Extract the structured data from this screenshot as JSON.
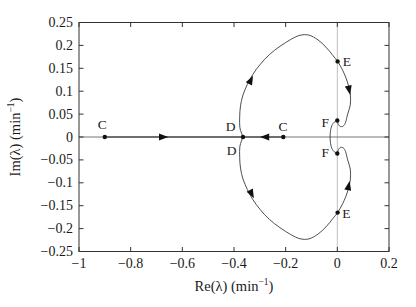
{
  "colors": {
    "curve": "#3a3a3a",
    "frame": "#333333",
    "gridline": "#b8b8b8",
    "real_axis": "#666666",
    "marker": "#111111",
    "text": "#1a1a1a"
  },
  "chart_data": {
    "type": "line",
    "title": "",
    "xlabel": {
      "pre": "Re(λ) (min",
      "sup": "−1",
      "post": ")"
    },
    "ylabel": {
      "pre": "Im(λ) (min",
      "sup": "−1",
      "post": ")"
    },
    "xlim": [
      -1,
      0.2
    ],
    "ylim": [
      -0.25,
      0.25
    ],
    "xticks": {
      "values": [
        -1,
        -0.8,
        -0.6,
        -0.4,
        -0.2,
        0,
        0.2
      ],
      "labels": [
        "−1",
        "−0.8",
        "−0.6",
        "−0.4",
        "−0.2",
        "0",
        "0.2"
      ]
    },
    "yticks": {
      "values": [
        0.25,
        0.2,
        0.15,
        0.1,
        0.05,
        0,
        -0.05,
        -0.1,
        -0.15,
        -0.2,
        -0.25
      ],
      "labels": [
        "0.25",
        "0.2",
        "0.15",
        "0.1",
        "0.05",
        "0",
        "−0.05",
        "−0.1",
        "−0.15",
        "−0.2",
        "−0.25"
      ]
    },
    "grid": {
      "vline_x": 0,
      "hline_y": 0,
      "legend": "none"
    },
    "real_axis_line": {
      "x1": -1,
      "x2": 0.2,
      "y": 0
    },
    "locus_real_segments": [
      {
        "x1": -0.9,
        "x2": -0.365
      },
      {
        "x1": -0.209,
        "x2": -0.365
      }
    ],
    "locus_loop": {
      "symmetric_about_real_axis": true,
      "upper_points": [
        [
          -0.365,
          0.0
        ],
        [
          -0.377,
          0.02
        ],
        [
          -0.378,
          0.044
        ],
        [
          -0.375,
          0.068
        ],
        [
          -0.365,
          0.092
        ],
        [
          -0.348,
          0.115
        ],
        [
          -0.327,
          0.137
        ],
        [
          -0.298,
          0.159
        ],
        [
          -0.263,
          0.18
        ],
        [
          -0.222,
          0.198
        ],
        [
          -0.18,
          0.213
        ],
        [
          -0.145,
          0.222
        ],
        [
          -0.11,
          0.2225
        ],
        [
          -0.075,
          0.212
        ],
        [
          -0.044,
          0.196
        ],
        [
          -0.017,
          0.178
        ],
        [
          0.002,
          0.164
        ],
        [
          0.021,
          0.145
        ],
        [
          0.039,
          0.12
        ],
        [
          0.05,
          0.094
        ],
        [
          0.05,
          0.07
        ],
        [
          0.04,
          0.05
        ],
        [
          0.032,
          0.032
        ],
        [
          0.023,
          0.024
        ],
        [
          0.011,
          0.023
        ],
        [
          0.003,
          0.029
        ],
        [
          0.0,
          0.036
        ]
      ],
      "arc_points": [
        [
          0.0,
          0.036
        ],
        [
          -0.016,
          0.03
        ],
        [
          -0.025,
          0.018
        ],
        [
          -0.028,
          0.0
        ],
        [
          -0.025,
          -0.018
        ],
        [
          -0.016,
          -0.03
        ],
        [
          0.0,
          -0.036
        ]
      ]
    },
    "dots": [
      [
        -0.9,
        0
      ],
      [
        -0.365,
        0
      ],
      [
        -0.209,
        0
      ],
      [
        0.001,
        0.165
      ],
      [
        0.001,
        -0.165
      ],
      [
        0.0,
        0.036
      ],
      [
        0.0,
        -0.036
      ]
    ],
    "labels": [
      {
        "text": "C",
        "x": -0.91,
        "y": 0.0277
      },
      {
        "text": "C",
        "x": -0.2106,
        "y": 0.0234
      },
      {
        "text": "D",
        "x": -0.4135,
        "y": 0.0234
      },
      {
        "text": "D",
        "x": -0.4097,
        "y": -0.029
      },
      {
        "text": "E",
        "x": 0.0367,
        "y": 0.1642
      },
      {
        "text": "E",
        "x": 0.0348,
        "y": -0.1677
      },
      {
        "text": "F",
        "x": -0.0464,
        "y": 0.0321
      },
      {
        "text": "F",
        "x": -0.0464,
        "y": -0.0345
      }
    ],
    "arrows": [
      {
        "x": -0.674,
        "y": 0,
        "angle": 0
      },
      {
        "x": -0.28,
        "y": 0,
        "angle": 180
      },
      {
        "x": -0.335,
        "y": 0.124,
        "angle": -63
      },
      {
        "x": 0.0456,
        "y": 0.103,
        "angle": 78
      },
      {
        "x": -0.332,
        "y": -0.124,
        "angle": 63
      },
      {
        "x": 0.0437,
        "y": -0.107,
        "angle": -78
      }
    ]
  }
}
